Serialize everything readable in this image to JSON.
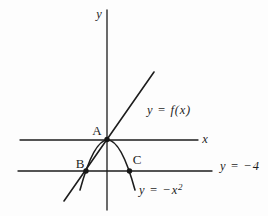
{
  "figure": {
    "background": "#fdfdfd",
    "ink": "#1d1d1d",
    "y_axis_label": "y",
    "x_axis_label": "x",
    "points": {
      "a": "A",
      "b": "B",
      "c": "C"
    },
    "labels": {
      "line": "y = f(x)",
      "horizontal_line": "y = −4",
      "parabola_base": "y = −x",
      "parabola_exponent": "2"
    }
  },
  "diagram_data": {
    "type": "math-figure",
    "curves": [
      {
        "name": "line",
        "equation": "y = f(x)"
      },
      {
        "name": "parabola",
        "equation": "y = −x²",
        "opens": "down",
        "vertex_at": "A"
      },
      {
        "name": "horizontal-line",
        "equation": "y = −4"
      }
    ],
    "points": [
      {
        "label": "A",
        "at": "origin, vertex of parabola on line y = f(x)"
      },
      {
        "label": "B",
        "at": "left intersection of parabola, line y = f(x) and line y = −4"
      },
      {
        "label": "C",
        "at": "right intersection of parabola and line y = −4"
      }
    ]
  }
}
